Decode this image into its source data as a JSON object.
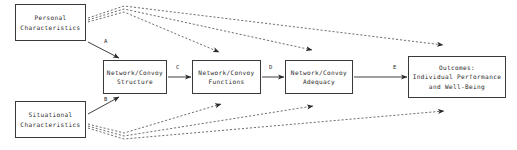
{
  "diagram": {
    "type": "flowchart",
    "canvas": {
      "width": 517,
      "height": 150,
      "background": "#ffffff"
    },
    "colors": {
      "box_border": "#3a3a3a",
      "box_fill": "#ffffff",
      "text": "#2b2b2b",
      "solid_edge": "#2b2b2b",
      "dashed_edge": "#555555"
    },
    "nodes": [
      {
        "id": "personal-characteristics",
        "label": "Personal\nCharacteristics",
        "x": 15,
        "y": 4,
        "width": 71,
        "height": 37
      },
      {
        "id": "situational-characteristics",
        "label": "Situational\nCharacteristics",
        "x": 15,
        "y": 101,
        "width": 71,
        "height": 37
      },
      {
        "id": "network-convoy-structure",
        "label": "Network/Convoy\nStructure",
        "x": 103,
        "y": 60,
        "width": 64,
        "height": 34
      },
      {
        "id": "network-convoy-functions",
        "label": "Network/Convoy\nFunctions",
        "x": 192,
        "y": 60,
        "width": 69,
        "height": 34
      },
      {
        "id": "network-convoy-adequacy",
        "label": "Network/Convoy\nAdequacy",
        "x": 285,
        "y": 60,
        "width": 68,
        "height": 34
      },
      {
        "id": "outcomes",
        "label": "Outcomes:\nIndividual Performance\nand Well-Being",
        "x": 408,
        "y": 56,
        "width": 98,
        "height": 42
      }
    ],
    "edge_labels": [
      {
        "id": "label-a",
        "text": "A",
        "x": 104,
        "y": 38
      },
      {
        "id": "label-b",
        "text": "B",
        "x": 104,
        "y": 96
      },
      {
        "id": "label-c",
        "text": "C",
        "x": 176,
        "y": 64
      },
      {
        "id": "label-d",
        "text": "D",
        "x": 269,
        "y": 64
      },
      {
        "id": "label-e",
        "text": "E",
        "x": 393,
        "y": 64
      }
    ],
    "solid_edges": [
      {
        "id": "edge-a",
        "from": "personal-characteristics",
        "to": "network-convoy-structure",
        "label": "A"
      },
      {
        "id": "edge-b",
        "from": "situational-characteristics",
        "to": "network-convoy-structure",
        "label": "B"
      },
      {
        "id": "edge-c",
        "from": "network-convoy-structure",
        "to": "network-convoy-functions",
        "label": "C"
      },
      {
        "id": "edge-d",
        "from": "network-convoy-functions",
        "to": "network-convoy-adequacy",
        "label": "D"
      },
      {
        "id": "edge-e",
        "from": "network-convoy-adequacy",
        "to": "outcomes",
        "label": "E"
      }
    ],
    "dashed_edges": [
      {
        "id": "dashed-personal-functions",
        "from": "personal-characteristics",
        "to": "network-convoy-functions"
      },
      {
        "id": "dashed-personal-adequacy",
        "from": "personal-characteristics",
        "to": "network-convoy-adequacy"
      },
      {
        "id": "dashed-personal-outcomes",
        "from": "personal-characteristics",
        "to": "outcomes"
      },
      {
        "id": "dashed-situational-functions",
        "from": "situational-characteristics",
        "to": "network-convoy-functions"
      },
      {
        "id": "dashed-situational-adequacy",
        "from": "situational-characteristics",
        "to": "network-convoy-adequacy"
      },
      {
        "id": "dashed-situational-outcomes",
        "from": "situational-characteristics",
        "to": "outcomes"
      }
    ]
  }
}
